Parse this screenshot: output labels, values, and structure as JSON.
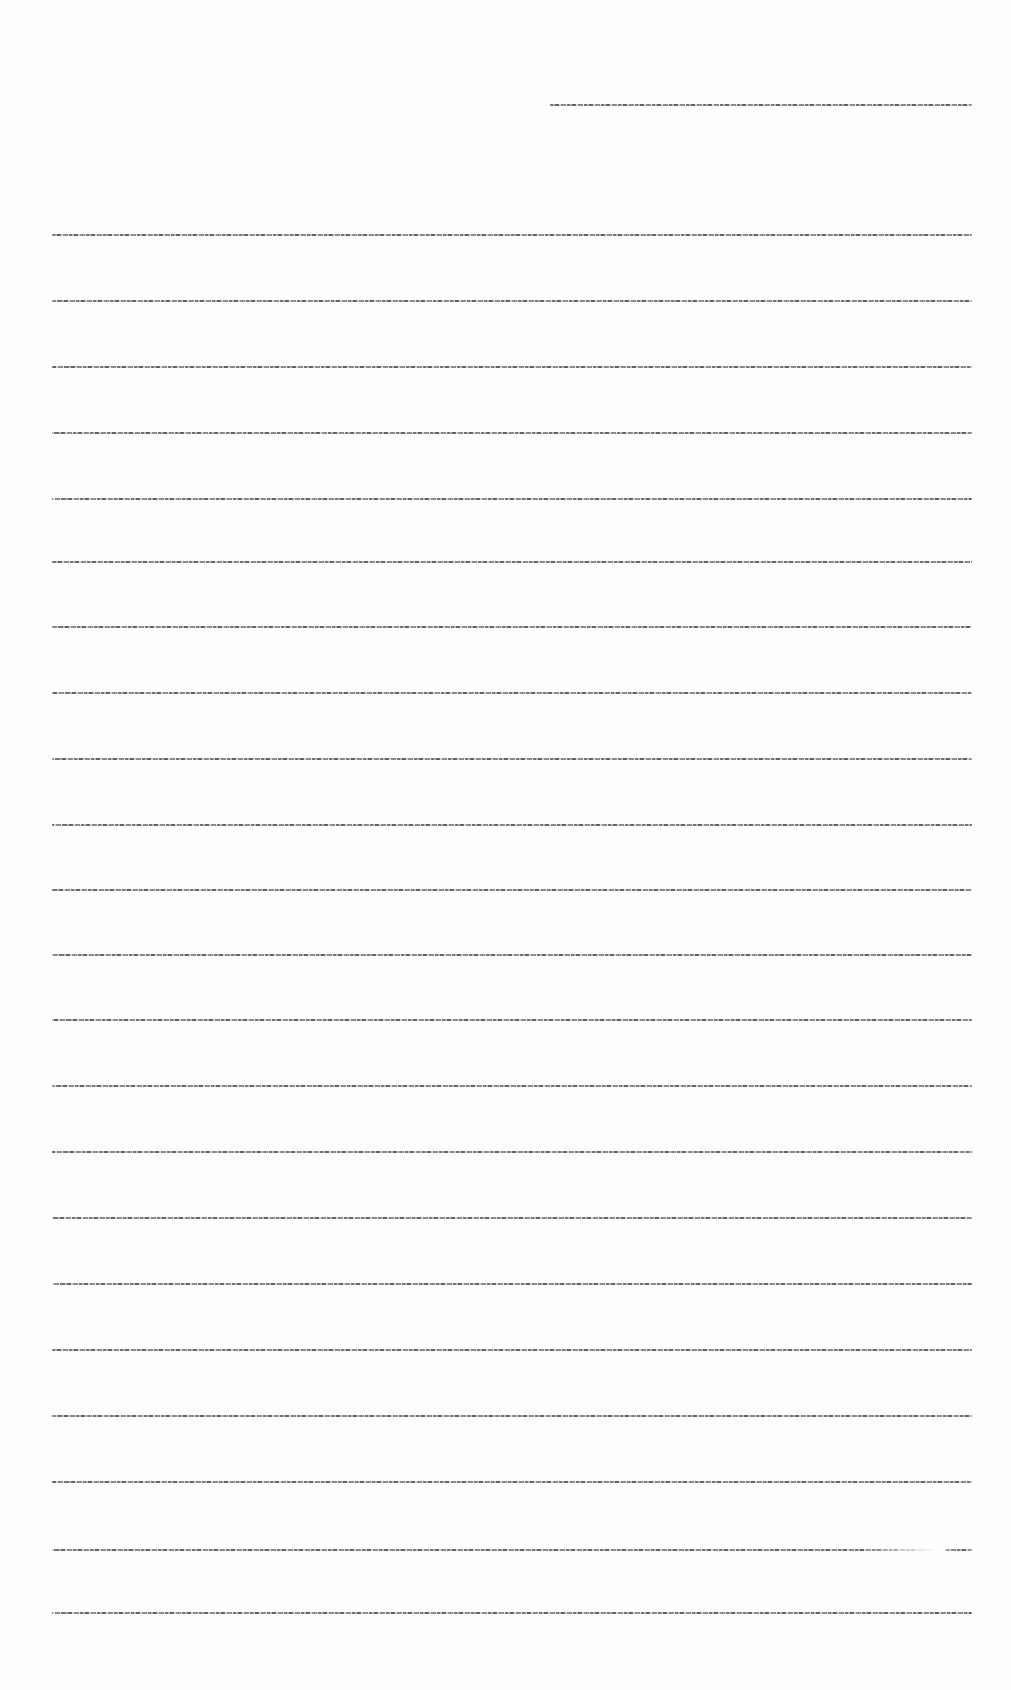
{
  "document": {
    "type": "lined-page",
    "header_line": {
      "x": 550,
      "y": 104,
      "width": 422
    },
    "body_lines": {
      "x": 52,
      "width": 920,
      "ys": [
        234,
        300,
        366,
        432,
        498,
        561,
        626,
        692,
        758,
        824,
        889,
        954,
        1019,
        1085,
        1151,
        1217,
        1283,
        1349,
        1415,
        1481,
        1549,
        1612
      ]
    },
    "legible_text": []
  }
}
